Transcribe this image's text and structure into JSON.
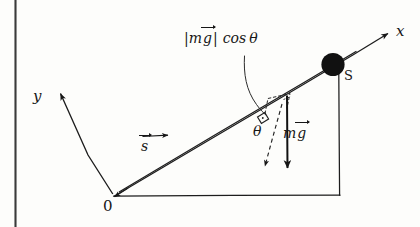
{
  "figure": {
    "kind": "hand-drawn-physics-diagram",
    "ink_color": "#161616",
    "paper_color": "#fdfdfb"
  },
  "labels": {
    "x_axis": "x",
    "y_axis": "y",
    "origin": "0",
    "point_s": "S",
    "theta": "θ",
    "displacement_symbol": "s",
    "gravity_symbol_prefix": "m",
    "gravity_symbol_vector": "g",
    "normal_component_open": "|",
    "normal_component_m": "m",
    "normal_component_g": "g",
    "normal_component_close": "|",
    "normal_component_cos": "cos",
    "normal_component_theta": "θ"
  },
  "elements": {
    "ball": "filled-circle-mass-at-S",
    "incline": "double-line-ramp-from-origin-to-S",
    "ground": "horizontal-base-line",
    "riser": "vertical-line-from-ground-to-S",
    "gravity_arrow": "solid-downward-arrow",
    "normal_component_arrow": "dashed-arrow-perpendicular-to-incline",
    "leader": "curved-leader-line-to-normal-component",
    "right_angle": "right-angle-mark-on-incline",
    "page_binding": "vertical-scan-edge-line"
  },
  "geometry": {
    "origin_point": [
      113,
      196
    ],
    "s_point": [
      339,
      62
    ],
    "foot_point": [
      339,
      196
    ],
    "x_arrow_tip": [
      388,
      32
    ],
    "y_arrow_tip": [
      58,
      92
    ],
    "gravity_tail": [
      287,
      95
    ],
    "gravity_tip": [
      287,
      171
    ],
    "normal_tip": [
      265,
      168
    ]
  }
}
